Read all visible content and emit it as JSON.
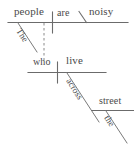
{
  "diagram": {
    "type": "reed-kellogg-sentence-diagram",
    "sentence": "The people are noisy who live across the street.",
    "ink_color": "#4a4a4a",
    "line_color": "#6b6b6b",
    "background_color": "#ffffff",
    "main_clause": {
      "subject": "people",
      "subject_modifier": "The",
      "linking_verb": "are",
      "predicate_adjective": "noisy"
    },
    "relative_clause": {
      "relative_pronoun": "who",
      "verb": "live",
      "preposition": "across",
      "object_of_preposition": "street",
      "object_modifier": "the"
    }
  }
}
